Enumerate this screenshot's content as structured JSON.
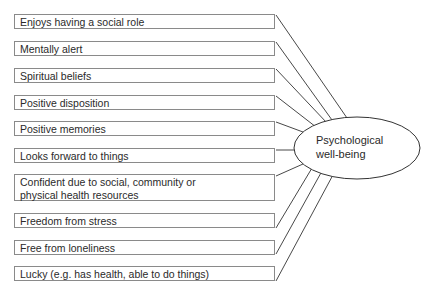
{
  "diagram": {
    "factors": [
      {
        "label": "Enjoys having a social role"
      },
      {
        "label": "Mentally alert"
      },
      {
        "label": "Spiritual beliefs"
      },
      {
        "label": "Positive disposition"
      },
      {
        "label": "Positive memories"
      },
      {
        "label": "Looks forward to things"
      },
      {
        "label": "Confident due to social, community or physical health resources"
      },
      {
        "label": "Freedom from stress"
      },
      {
        "label": "Free from loneliness"
      },
      {
        "label": "Lucky (e.g. has health, able to do things)"
      }
    ],
    "outcome": {
      "line1": "Psychological",
      "line2": "well-being"
    },
    "colors": {
      "line": "#333333",
      "box_border": "#8a8a8a",
      "background": "#ffffff"
    }
  }
}
